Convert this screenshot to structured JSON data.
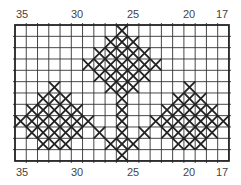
{
  "grid": {
    "columns": 19,
    "rows": 12,
    "left": 15,
    "top": 25,
    "cell_w": 11.26,
    "cell_h": 11.33,
    "line_color": "#333333",
    "stitch_color": "#222222"
  },
  "top_labels": [
    {
      "text": "35",
      "x": 22
    },
    {
      "text": "30",
      "x": 77
    },
    {
      "text": "25",
      "x": 133
    },
    {
      "text": "20",
      "x": 189
    },
    {
      "text": "17",
      "x": 222
    }
  ],
  "bottom_labels": [
    {
      "text": "35",
      "x": 22
    },
    {
      "text": "30",
      "x": 77
    },
    {
      "text": "25",
      "x": 133
    },
    {
      "text": "20",
      "x": 189
    },
    {
      "text": "17",
      "x": 222
    }
  ],
  "stitches": [
    {
      "row": 0,
      "cols": [
        9
      ]
    },
    {
      "row": 1,
      "cols": [
        8,
        9,
        10
      ]
    },
    {
      "row": 2,
      "cols": [
        7,
        8,
        9,
        10,
        11
      ]
    },
    {
      "row": 3,
      "cols": [
        6,
        7,
        8,
        9,
        10,
        11,
        12
      ]
    },
    {
      "row": 4,
      "cols": [
        7,
        8,
        9,
        10,
        11
      ]
    },
    {
      "row": 5,
      "cols": [
        3,
        8,
        9,
        10,
        15
      ]
    },
    {
      "row": 6,
      "cols": [
        2,
        3,
        4,
        9,
        14,
        15,
        16
      ]
    },
    {
      "row": 7,
      "cols": [
        1,
        2,
        3,
        4,
        5,
        9,
        13,
        14,
        15,
        16,
        17
      ]
    },
    {
      "row": 8,
      "cols": [
        0,
        1,
        2,
        3,
        4,
        5,
        6,
        9,
        12,
        13,
        14,
        15,
        16,
        17,
        18
      ]
    },
    {
      "row": 9,
      "cols": [
        1,
        2,
        3,
        4,
        5,
        7,
        9,
        11,
        13,
        14,
        15,
        16,
        17
      ]
    },
    {
      "row": 10,
      "cols": [
        2,
        3,
        4,
        8,
        9,
        10,
        14,
        15,
        16
      ]
    },
    {
      "row": 11,
      "cols": [
        9
      ]
    }
  ]
}
